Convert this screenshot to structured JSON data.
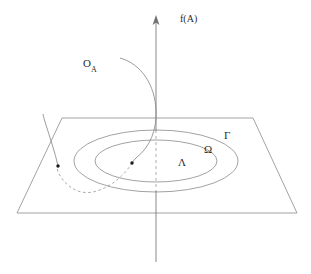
{
  "figure": {
    "background_color": "#ffffff",
    "line_color": "#6f6f6f",
    "curve_color": "#7a7a7a",
    "axis_color": "#6f6f6f",
    "text_color": "#2b2b2b",
    "width": 311,
    "height": 274
  },
  "axis": {
    "name": "vertical-axis",
    "label": "f(A)",
    "label_x": 180,
    "label_y": 14,
    "arrow_tip_y": 16,
    "bottom_y": 262,
    "x": 156
  },
  "plane": {
    "name": "base-plane",
    "corners": [
      {
        "x": 62,
        "y": 118
      },
      {
        "x": 253,
        "y": 118
      },
      {
        "x": 297,
        "y": 213
      },
      {
        "x": 17,
        "y": 213
      }
    ]
  },
  "ellipses": [
    {
      "id": "gamma",
      "label": "Γ",
      "label_x": 224,
      "label_y": 130,
      "rx": 82,
      "ry": 31,
      "cx": 156,
      "cy": 161
    },
    {
      "id": "omega",
      "label": "Ω",
      "label_x": 204,
      "label_y": 144,
      "rx": 61,
      "ry": 21,
      "cx": 156,
      "cy": 161
    },
    {
      "id": "lambda",
      "label": "Λ",
      "label_x": 178,
      "label_y": 157,
      "rx": 0,
      "ry": 0,
      "cx": 156,
      "cy": 161
    }
  ],
  "orbit": {
    "name": "orbit-curve",
    "label_main": "O",
    "label_sub": "A",
    "label_x": 83,
    "label_y": 58,
    "points": [
      {
        "id": "point-left",
        "x": 58,
        "y": 166
      },
      {
        "id": "point-center",
        "x": 132,
        "y": 163
      }
    ]
  }
}
